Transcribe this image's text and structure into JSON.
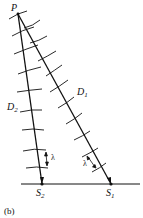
{
  "diagram": {
    "point_label": "P",
    "path1_label": "D",
    "path1_sub": "1",
    "path2_label": "D",
    "path2_sub": "2",
    "source1_label": "S",
    "source1_sub": "1",
    "source2_label": "S",
    "source2_sub": "2",
    "wavelength_label": "λ",
    "panel_label": "(b)",
    "line_color": "#111111"
  }
}
